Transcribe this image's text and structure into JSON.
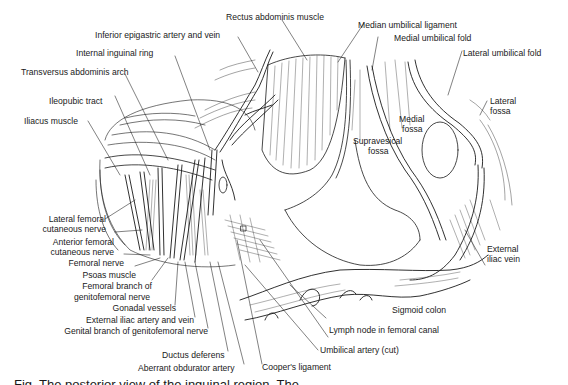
{
  "figure": {
    "type": "anatomical line illustration",
    "labels_top": {
      "rectus_abdominis": "Rectus abdominis muscle",
      "inferior_epigastric": "Inferior epigastric artery and vein",
      "internal_inguinal_ring": "Internal inguinal ring",
      "transversus_arch": "Transversus abdominis arch",
      "ileopubic_tract": "Ileopubic tract",
      "iliacus": "Iliacus muscle",
      "median_umbilical_ligament": "Median umbilical ligament",
      "medial_umbilical_fold": "Medial umbilical fold",
      "lateral_umbilical_fold": "Lateral umbilical fold",
      "lateral_fossa_1": "Lateral",
      "lateral_fossa_2": "fossa",
      "medial_fossa_1": "Medial",
      "medial_fossa_2": "fossa",
      "supravesical_fossa_1": "Supravesical",
      "supravesical_fossa_2": "fossa"
    },
    "labels_left": {
      "lateral_femoral_cutaneous_1": "Lateral femoral",
      "lateral_femoral_cutaneous_2": "cutaneous nerve",
      "anterior_femoral_cutaneous_1": "Anterior femoral",
      "anterior_femoral_cutaneous_2": "cutaneous nerve",
      "femoral_nerve": "Femoral nerve",
      "psoas": "Psoas muscle",
      "femoral_branch_1": "Femoral branch of",
      "femoral_branch_2": "genitofemoral nerve",
      "gonadal_vessels": "Gonadal vessels",
      "external_iliac_artery_vein": "External iliac artery and vein",
      "genital_branch": "Genital branch of genitofemoral nerve"
    },
    "labels_bottom": {
      "ductus_deferens": "Ductus deferens",
      "aberrant_obdurator": "Aberrant obdurator artery",
      "coopers_ligament": "Cooper's ligament",
      "umbilical_artery": "Umbilical artery (cut)",
      "lymph_node": "Lymph node in femoral canal",
      "sigmoid_colon": "Sigmoid colon"
    },
    "labels_right": {
      "external_iliac_vein_1": "External",
      "external_iliac_vein_2": "iliac vein"
    },
    "caption_partial": "Fig.   The posterior view of the inguinal region.   The"
  },
  "colors": {
    "ink": "#1a1a1a",
    "background": "#ffffff"
  }
}
